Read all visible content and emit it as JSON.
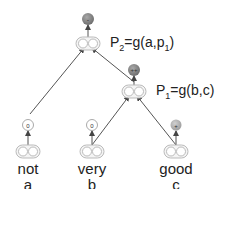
{
  "nodes": {
    "p2": {
      "label_prefix": "P",
      "label_sub": "2",
      "label_expr_a": "=g(a,p",
      "label_expr_sub": "1",
      "label_expr_end": ")",
      "sentiment": "-",
      "sentiment_color": "#8a8a8a"
    },
    "p1": {
      "label_prefix": "P",
      "label_sub": "1",
      "label_expr": "=g(b,c)",
      "sentiment": "++",
      "sentiment_color": "#7a7a7a"
    },
    "not": {
      "word": "not",
      "var": "a",
      "sentiment": "0",
      "sentiment_color": "#ffffff"
    },
    "very": {
      "word": "very",
      "var": "b",
      "sentiment": "0",
      "sentiment_color": "#ffffff"
    },
    "good": {
      "word": "good",
      "var": "c",
      "sentiment": "+",
      "sentiment_color": "#b0b0b0"
    }
  },
  "colors": {
    "edge": "#555555",
    "vector_fill": "#f2f2f2",
    "vector_stroke": "#bbbbbb"
  }
}
